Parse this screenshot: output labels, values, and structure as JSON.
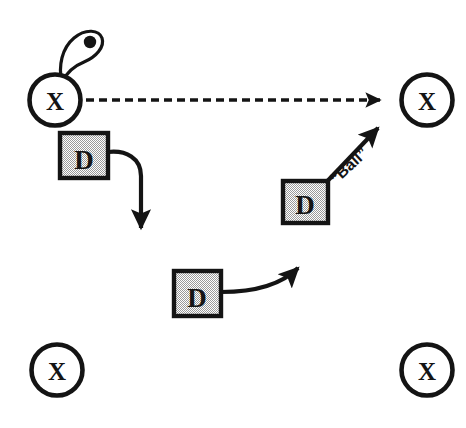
{
  "diagram": {
    "background_color": "#ffffff",
    "ink_color": "#141414",
    "defense_fill_color": "#c9c9c9",
    "offense": {
      "symbol": "X",
      "players": [
        {
          "id": "x-top-left",
          "label": "X",
          "cx": 55,
          "cy": 100
        },
        {
          "id": "x-top-right",
          "label": "X",
          "cx": 427,
          "cy": 100
        },
        {
          "id": "x-bottom-left",
          "label": "X",
          "cx": 57,
          "cy": 370
        },
        {
          "id": "x-bottom-right",
          "label": "X",
          "cx": 427,
          "cy": 370
        }
      ]
    },
    "defense": {
      "symbol": "D",
      "players": [
        {
          "id": "d-upper-left",
          "label": "D",
          "x": 60,
          "y": 133
        },
        {
          "id": "d-right",
          "label": "D",
          "x": 283,
          "y": 181
        },
        {
          "id": "d-center",
          "label": "D",
          "x": 174,
          "y": 271
        }
      ]
    },
    "ball": {
      "label": "“Ball”",
      "holder": "x-top-left",
      "symbol_name": "ball-in-hand-loop"
    },
    "movements": [
      {
        "id": "pass-line",
        "type": "pass",
        "style": "dashed",
        "from": "x-top-left",
        "to": "x-top-right",
        "label": ""
      },
      {
        "id": "defender-hook-path",
        "type": "movement",
        "style": "solid-curved",
        "from": "d-upper-left",
        "to": "open-floor",
        "label": ""
      },
      {
        "id": "defender-center-path",
        "type": "movement",
        "style": "solid-curved",
        "from": "d-center",
        "to": "open-floor",
        "label": ""
      },
      {
        "id": "defender-ball-path",
        "type": "movement",
        "style": "solid-straight",
        "from": "d-right",
        "to": "x-top-right",
        "label": "“Ball”"
      }
    ]
  }
}
